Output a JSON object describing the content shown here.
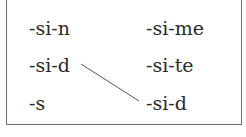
{
  "diagram": {
    "left_column": [
      "-si-n",
      "-si-d",
      "-s"
    ],
    "right_column": [
      "-si-me",
      "-si-te",
      "-si-d"
    ],
    "connections": [
      {
        "from": "left_column.1",
        "to": "right_column.2",
        "label": "-si-d to -si-d"
      }
    ],
    "colors": {
      "text": "#2a2a2a",
      "border": "#6e6e6e",
      "line": "#555555"
    }
  }
}
